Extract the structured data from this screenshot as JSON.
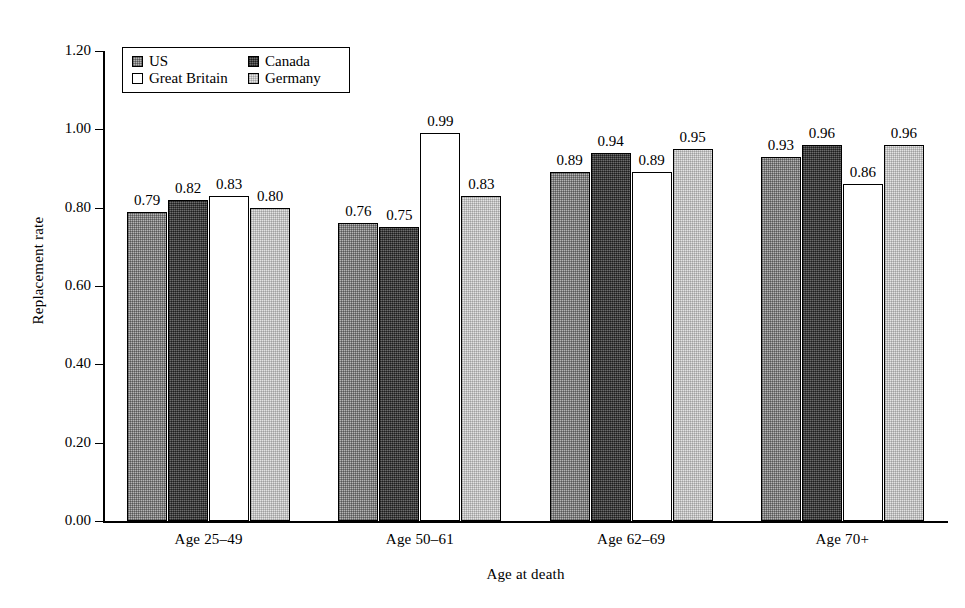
{
  "chart_data": {
    "type": "bar",
    "title": "",
    "xlabel": "Age at death",
    "ylabel": "Replacement rate",
    "categories": [
      "Age 25–49",
      "Age 50–61",
      "Age 62–69",
      "Age 70+"
    ],
    "series": [
      {
        "name": "US",
        "values": [
          0.79,
          0.76,
          0.89,
          0.93
        ],
        "labels": [
          "0.79",
          "0.76",
          "0.89",
          "0.93"
        ],
        "swatch": "medium-gray-dither"
      },
      {
        "name": "Canada",
        "values": [
          0.82,
          0.75,
          0.94,
          0.96
        ],
        "labels": [
          "0.82",
          "0.75",
          "0.94",
          "0.96"
        ],
        "swatch": "dark-gray-dither"
      },
      {
        "name": "Great Britain",
        "values": [
          0.83,
          0.99,
          0.89,
          0.86
        ],
        "labels": [
          "0.83",
          "0.99",
          "0.89",
          "0.86"
        ],
        "swatch": "white"
      },
      {
        "name": "Germany",
        "values": [
          0.8,
          0.83,
          0.95,
          0.96
        ],
        "labels": [
          "0.80",
          "0.83",
          "0.95",
          "0.96"
        ],
        "swatch": "light-gray-dither"
      }
    ],
    "ylim": [
      0.0,
      1.2
    ],
    "ytick_values": [
      0.0,
      0.2,
      0.4,
      0.6,
      0.8,
      1.0,
      1.2
    ],
    "ytick_labels": [
      "0.00",
      "0.20",
      "0.40",
      "0.60",
      "0.80",
      "1.00",
      "1.20"
    ],
    "grid": false,
    "legend_position": "top-left-inside",
    "legend_entries": [
      "US",
      "Canada",
      "Great Britain",
      "Germany"
    ]
  },
  "axes": {
    "y_label": "Replacement rate",
    "x_label": "Age at death"
  },
  "legend": {
    "items": [
      {
        "label": "US"
      },
      {
        "label": "Canada"
      },
      {
        "label": "Great Britain"
      },
      {
        "label": "Germany"
      }
    ]
  },
  "colors": {
    "axis": "#000000",
    "us": "#b4b4b4",
    "canada": "#4a4a4a",
    "great_britain": "#ffffff",
    "germany": "#e3e3e3",
    "background": "#ffffff"
  }
}
